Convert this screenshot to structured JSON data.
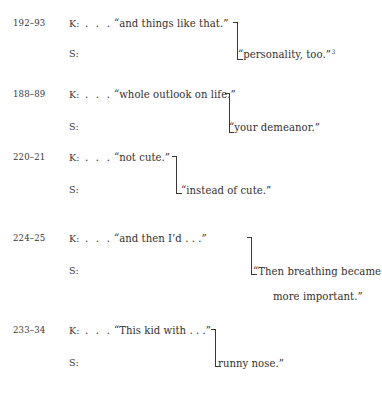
{
  "document": {
    "type": "transcript-excerpt",
    "background_color": "#ffffff",
    "text_color": "#332f2d"
  },
  "groups": [
    {
      "line_numbers": "192–93",
      "k_speaker": "K:",
      "k_ellipsis": ". . .",
      "k_text": "“and things like that.”",
      "s_speaker": "S:",
      "s_text": "“personality, too.”",
      "s_footnote": "3",
      "s_text_continued": ""
    },
    {
      "line_numbers": "188–89",
      "k_speaker": "K:",
      "k_ellipsis": ". . .",
      "k_text": "“whole outlook on life.”",
      "s_speaker": "S:",
      "s_text": "“your demeanor.”",
      "s_footnote": "",
      "s_text_continued": ""
    },
    {
      "line_numbers": "220–21",
      "k_speaker": "K:",
      "k_ellipsis": ". . .",
      "k_text": "“not cute.”",
      "s_speaker": "S:",
      "s_text": "“instead of cute.”",
      "s_footnote": "",
      "s_text_continued": ""
    },
    {
      "line_numbers": "224–25",
      "k_speaker": "K:",
      "k_ellipsis": ". . .",
      "k_text": "“and then I’d . . .”",
      "s_speaker": "S:",
      "s_text": "“Then breathing became",
      "s_footnote": "",
      "s_text_continued": "more important.”"
    },
    {
      "line_numbers": "233–34",
      "k_speaker": "K:",
      "k_ellipsis": ". . .",
      "k_text": "“This kid with . . .”",
      "s_speaker": "S:",
      "s_text": "runny nose.”",
      "s_footnote": "",
      "s_text_continued": ""
    }
  ],
  "layout": {
    "group_tops": [
      18,
      89,
      152,
      233,
      325
    ],
    "s_row_offset": [
      30,
      32,
      32,
      32,
      32
    ],
    "bracket": [
      {
        "left": 232,
        "top": 4,
        "height": 38,
        "text_left": 238
      },
      {
        "left": 225,
        "top": 4,
        "height": 40,
        "text_left": 229
      },
      {
        "left": 171,
        "top": 4,
        "height": 38,
        "text_left": 180
      },
      {
        "left": 246,
        "top": 4,
        "height": 38,
        "text_left": 253
      },
      {
        "left": 210,
        "top": 4,
        "height": 38,
        "text_left": 217
      }
    ],
    "continued_indent": [
      0,
      0,
      0,
      273,
      0
    ]
  }
}
